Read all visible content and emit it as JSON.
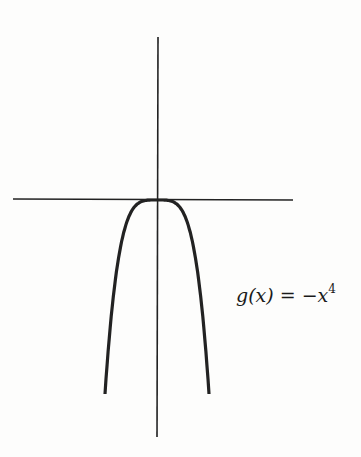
{
  "chart_data": {
    "type": "line",
    "title": "",
    "xlabel": "",
    "ylabel": "",
    "grid": false,
    "series": [
      {
        "name": "g(x) = -x^4",
        "function": "-x^4",
        "x": [
          -1.0,
          -0.8,
          -0.6,
          -0.4,
          -0.2,
          0,
          0.2,
          0.4,
          0.6,
          0.8,
          1.0
        ],
        "values": [
          -1.0,
          -0.4096,
          -0.1296,
          -0.0256,
          -0.0016,
          0,
          -0.0016,
          -0.0256,
          -0.1296,
          -0.4096,
          -1.0
        ]
      }
    ],
    "annotations": [
      {
        "text_prefix": "g(x)  =  −x",
        "exponent": "4"
      }
    ]
  },
  "colors": {
    "ink": "#222222",
    "background": "#fdfdfc"
  }
}
